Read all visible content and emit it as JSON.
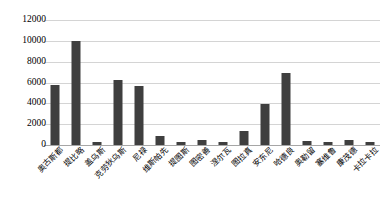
{
  "chart_data": {
    "type": "bar",
    "title": "",
    "xlabel": "",
    "ylabel": "",
    "ylim": [
      0,
      12000
    ],
    "yticks": [
      0,
      2000,
      4000,
      6000,
      8000,
      10000,
      12000
    ],
    "ytick_labels": [
      "0",
      "2000",
      "4000",
      "6000",
      "8000",
      "10000",
      "12000"
    ],
    "grid": true,
    "legend": false,
    "bar_color": "#3f3f3f",
    "categories": [
      "奥古斯都",
      "提比略",
      "盖乌斯",
      "克劳狄乌斯",
      "尼禄",
      "维斯帕先",
      "提图斯",
      "图密善",
      "涅尔瓦",
      "图拉真",
      "安东尼",
      "哈德良",
      "奥勒留",
      "塞维鲁",
      "康茂德",
      "卡拉卡拉"
    ],
    "values": [
      5800,
      9950,
      300,
      6250,
      5650,
      900,
      300,
      450,
      250,
      1300,
      3900,
      6900,
      350,
      250,
      500,
      250
    ]
  }
}
